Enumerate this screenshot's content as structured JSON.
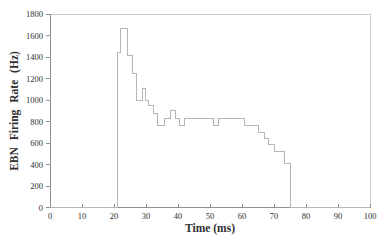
{
  "figure": {
    "background": "#ffffff"
  },
  "chart_data": {
    "type": "line",
    "subtype": "step-after",
    "title": "",
    "xlabel": "Time (ms)",
    "ylabel": "EBN Firing Rate (Hz)",
    "xlim": [
      0,
      100
    ],
    "ylim": [
      0,
      1800
    ],
    "x_ticks": [
      0,
      10,
      20,
      30,
      40,
      50,
      60,
      70,
      80,
      90,
      100
    ],
    "y_ticks": [
      0,
      200,
      400,
      600,
      800,
      1000,
      1200,
      1400,
      1600,
      1800
    ],
    "grid": false,
    "legend": "none",
    "series": [
      {
        "name": "EBN firing rate",
        "mode": "step-after",
        "points": [
          [
            0,
            0
          ],
          [
            21.0,
            1440
          ],
          [
            22.1,
            1665
          ],
          [
            24.2,
            1410
          ],
          [
            25.8,
            1245
          ],
          [
            27.0,
            1000
          ],
          [
            28.8,
            1110
          ],
          [
            29.9,
            1000
          ],
          [
            30.9,
            945
          ],
          [
            32.3,
            875
          ],
          [
            33.5,
            760
          ],
          [
            35.8,
            830
          ],
          [
            37.8,
            905
          ],
          [
            39.1,
            830
          ],
          [
            40.6,
            760
          ],
          [
            41.9,
            830
          ],
          [
            51.2,
            760
          ],
          [
            52.5,
            830
          ],
          [
            60.9,
            760
          ],
          [
            65.3,
            700
          ],
          [
            66.9,
            645
          ],
          [
            68.4,
            585
          ],
          [
            70.3,
            520
          ],
          [
            73.2,
            410
          ],
          [
            75.2,
            0
          ],
          [
            100,
            0
          ]
        ]
      }
    ],
    "colors": {
      "line": "#b6b6b6",
      "axis": "#8f8f8f",
      "frame": "#cccccc",
      "text": "#2f2f2f"
    }
  }
}
